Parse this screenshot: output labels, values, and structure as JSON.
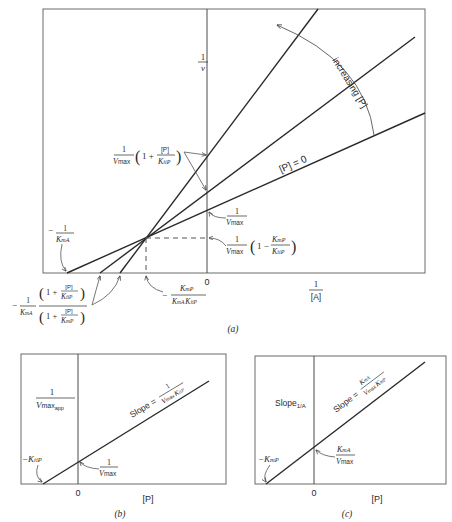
{
  "figure": {
    "panel_a": {
      "caption": "(a)",
      "y_axis_label_num": "1",
      "y_axis_label_den": "v",
      "x_axis_label_num": "1",
      "x_axis_label_den": "[A]",
      "origin_label": "0",
      "line_p0_label": "[P] = 0",
      "increasing_label": "increasing [P]",
      "label_intercept_inhibited": {
        "num": "1",
        "den": "V",
        "den_sub": "max",
        "paren_open": "(",
        "one_plus": "1 +",
        "p": "[P]",
        "k": "K",
        "k_sub": "iiP",
        "paren_close": ")"
      },
      "label_1_over_vmax": {
        "num": "1",
        "den": "V",
        "den_sub": "max"
      },
      "label_intersection_y": {
        "num": "1",
        "den": "V",
        "den_sub": "max",
        "one_minus": "1 −",
        "k_num": "K",
        "k_num_sub": "mP",
        "k_den": "K",
        "k_den_sub": "iiP"
      },
      "label_neg_1_over_kma": {
        "minus": "−",
        "num": "1",
        "den": "K",
        "den_sub": "mA"
      },
      "label_intersection_x": {
        "minus": "−",
        "num": "K",
        "num_sub": "mP",
        "den_a": "K",
        "den_a_sub": "mA",
        "den_b": "K",
        "den_b_sub": "iiP"
      },
      "label_x_intercepts": {
        "minus": "−",
        "frac_num": "1",
        "frac_den": "K",
        "frac_den_sub": "mA",
        "top": "1 +",
        "top_p": "[P]",
        "top_k": "K",
        "top_k_sub": "iiP",
        "bottom": "1 +",
        "bottom_p": "[P]",
        "bottom_k": "K",
        "bottom_k_sub": "mP"
      }
    },
    "panel_b": {
      "caption": "(b)",
      "y_label_num": "1",
      "y_label_den": "V",
      "y_label_den_sub": "max",
      "y_label_den_sub2": "app",
      "x_axis_label": "[P]",
      "origin_label": "0",
      "slope_text": "Slope =",
      "slope_num": "1",
      "slope_den": "V",
      "slope_den_sub": "max",
      "slope_den_k": "K",
      "slope_den_k_sub": "iiP",
      "x_intercept_label": "−K",
      "x_intercept_sub": "iiP",
      "y_intercept_num": "1",
      "y_intercept_den": "V",
      "y_intercept_den_sub": "max"
    },
    "panel_c": {
      "caption": "(c)",
      "y_label": "Slope",
      "y_label_sub": "1/A",
      "x_axis_label": "[P]",
      "origin_label": "0",
      "slope_text": "Slope =",
      "slope_num": "K",
      "slope_num_sub": "mA",
      "slope_den": "V",
      "slope_den_sub": "max",
      "slope_den_k": "K",
      "slope_den_k_sub": "mP",
      "x_intercept_label": "−K",
      "x_intercept_sub": "mP",
      "y_intercept_num": "K",
      "y_intercept_num_sub": "mA",
      "y_intercept_den": "V",
      "y_intercept_den_sub": "max"
    }
  }
}
